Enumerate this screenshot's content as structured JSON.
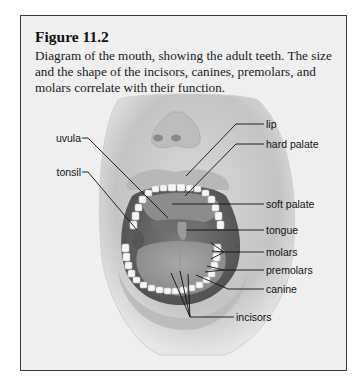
{
  "figure": {
    "title": "Figure 11.2",
    "caption": "Diagram of the mouth, showing the adult teeth. The size and the shape of the incisors, canines, premolars, and molars correlate with their function."
  },
  "labels": {
    "left": [
      "uvula",
      "tonsil"
    ],
    "right": [
      "lip",
      "hard palate",
      "soft palate",
      "tongue",
      "molars",
      "premolars",
      "canine"
    ],
    "bottom": [
      "incisors"
    ]
  },
  "colors": {
    "box_background": "#efefef",
    "border": "#3a3a3a",
    "leader_line": "#111111",
    "teeth": "#f6f6f2",
    "mouth_dark": "#5e5e5e"
  }
}
